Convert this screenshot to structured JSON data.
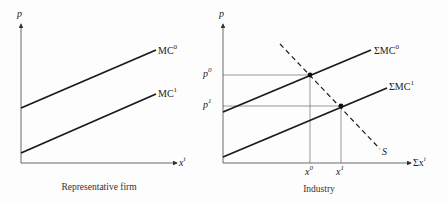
{
  "left_panel": {
    "caption": "Representative firm",
    "y_axis_label": "p",
    "x_axis_label": "x",
    "x_axis_label_sup": "i",
    "curves": [
      {
        "name": "MC",
        "sup": "0"
      },
      {
        "name": "MC",
        "sup": "1"
      }
    ]
  },
  "right_panel": {
    "caption": "Industry",
    "y_axis_label": "p",
    "x_axis_label": "Σx",
    "x_axis_label_sup": "i",
    "curves": [
      {
        "name": "ΣMC",
        "sup": "0"
      },
      {
        "name": "ΣMC",
        "sup": "1"
      }
    ],
    "supply_label": "S",
    "price_ticks": [
      {
        "name": "p",
        "sup": "0"
      },
      {
        "name": "p",
        "sup": "1"
      }
    ],
    "quantity_ticks": [
      {
        "name": "x",
        "sup": "0"
      },
      {
        "name": "x",
        "sup": "1"
      }
    ]
  },
  "colors": {
    "line": "#1a1a1a",
    "guide": "#555555",
    "background": "#fdfdfd"
  }
}
